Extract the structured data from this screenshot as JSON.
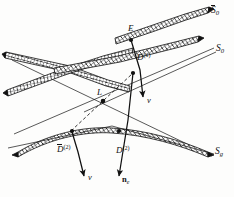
{
  "figure": {
    "kind": "ray-geometry-diagram",
    "background_color": "#fdfdfc",
    "ink_color": "#111111"
  },
  "labels": {
    "surface_top": {
      "base": "S",
      "overbar": true,
      "sub": "0",
      "text": "S̄0"
    },
    "surface_middle": {
      "base": "S",
      "overbar": false,
      "sub": "0",
      "text": "S0"
    },
    "surface_bottom": {
      "base": "S",
      "overbar": false,
      "sub": "g",
      "text": "Sg"
    },
    "point_emitter": {
      "text": "E"
    },
    "point_source": {
      "text": "L"
    },
    "detector_top": {
      "base": "D",
      "overbar": false,
      "sup": "(1)",
      "text": "D(1)"
    },
    "detector_bot_left": {
      "base": "D",
      "overbar": true,
      "sup": "(2)",
      "text": "D̄(2)"
    },
    "detector_bot_right": {
      "base": "D",
      "overbar": false,
      "sup": "(2)",
      "text": "D(2)"
    },
    "vector_nu_upper": {
      "text": "ν"
    },
    "vector_nu_lower": {
      "text": "ν"
    },
    "vector_normal": {
      "base": "n",
      "sub": "e",
      "text": "ne"
    }
  },
  "geometry": {
    "bands": [
      {
        "name": "band-top-right",
        "hatched": true,
        "note": "upper-right ribbon running to S̄0 label"
      },
      {
        "name": "band-middle-right",
        "hatched": true,
        "note": "middle ribbon running to S0 label"
      },
      {
        "name": "band-upper-left-down",
        "hatched": true,
        "note": "left ribbon descending to the right"
      },
      {
        "name": "band-upper-left-up",
        "hatched": true,
        "note": "left ribbon ascending to the right"
      },
      {
        "name": "band-bottom-arc",
        "hatched": true,
        "note": "lower curved arc ribbon to Sg label"
      }
    ],
    "thin_lines": [
      {
        "name": "line-S0-extension",
        "note": "thin straight line through middle to S0"
      },
      {
        "name": "line-Sg-extension",
        "note": "thin straight line through lower arc to Sg"
      },
      {
        "name": "line-L-up-right",
        "note": "thin ray from L up-right"
      },
      {
        "name": "line-L-down-left",
        "note": "thin ray from L down-left"
      }
    ],
    "dashed_rays": [
      {
        "name": "dashed-L-to-D1",
        "from": "L",
        "to": "D(1)"
      },
      {
        "name": "dashed-L-to-D2bar",
        "from": "L",
        "to": "D̄(2)"
      }
    ],
    "arrows": [
      {
        "name": "arrow-E-to-nu",
        "tail": "E",
        "head": "ν (upper)"
      },
      {
        "name": "arrow-D1-to-ne",
        "tail": "D(1)",
        "head": "ne"
      },
      {
        "name": "arrow-D2bar-to-nu",
        "tail": "D̄(2)",
        "head": "ν (lower)"
      }
    ],
    "nodes": [
      "E",
      "D(1)",
      "L",
      "D̄(2)",
      "D(2)"
    ]
  }
}
